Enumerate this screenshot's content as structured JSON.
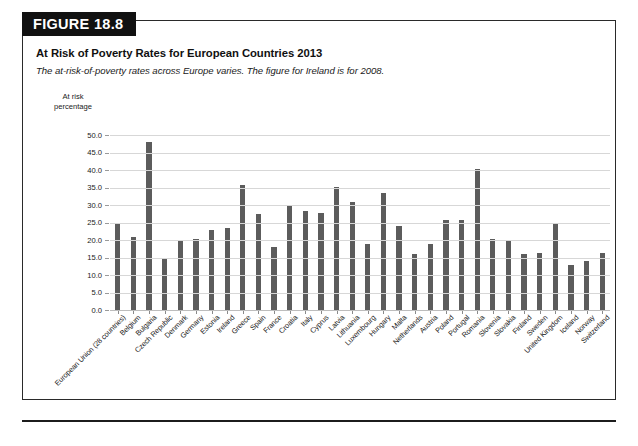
{
  "figure": {
    "badge_label": "FIGURE 18.8",
    "title": "At Risk of Poverty Rates for European Countries 2013",
    "subtitle": "The at-risk-of-poverty rates across Europe varies. The figure for Ireland is for 2008.",
    "axis_caption_line1": "At risk",
    "axis_caption_line2": "percentage"
  },
  "colors": {
    "bar": "#5c5c5c",
    "badge_background": "#111111",
    "badge_text": "#ffffff",
    "gridline": "#d7d7d7",
    "frame": "#2a2a2a"
  },
  "chart_data": {
    "type": "bar",
    "title": "At Risk of Poverty Rates for European Countries 2013",
    "subtitle": "The at-risk-of-poverty rates across Europe varies. The figure for Ireland is for 2008.",
    "xlabel": "",
    "ylabel": "At risk percentage",
    "ylim": [
      0.0,
      50.0
    ],
    "ytick_labels": [
      "50.0",
      "45.0",
      "40.0",
      "35.0",
      "30.0",
      "25.0",
      "20.0",
      "15.0",
      "10.0",
      "5.0",
      "0.0"
    ],
    "ytick_values": [
      50.0,
      45.0,
      40.0,
      35.0,
      30.0,
      25.0,
      20.0,
      15.0,
      10.0,
      5.0,
      0.0
    ],
    "grid": true,
    "legend": false,
    "categories": [
      "European Union (28 countries)",
      "Belgium",
      "Bulgaria",
      "Czech Republic",
      "Denmark",
      "Germany",
      "Estonia",
      "Ireland",
      "Greece",
      "Spain",
      "France",
      "Croatia",
      "Italy",
      "Cyprus",
      "Latvia",
      "Lithuania",
      "Luxembourg",
      "Hungary",
      "Malta",
      "Netherlands",
      "Austria",
      "Poland",
      "Portugal",
      "Romania",
      "Slovenia",
      "Slovakia",
      "Finland",
      "Sweden",
      "United Kingdom",
      "Iceland",
      "Norway",
      "Switzerland"
    ],
    "values": [
      24.5,
      20.8,
      48.0,
      14.6,
      20.0,
      20.3,
      23.0,
      23.5,
      35.7,
      27.3,
      18.1,
      29.9,
      28.4,
      27.8,
      35.1,
      30.8,
      19.0,
      33.5,
      24.0,
      15.9,
      18.8,
      25.8,
      25.6,
      40.4,
      20.4,
      19.8,
      16.0,
      16.4,
      24.8,
      13.0,
      14.1,
      16.4
    ]
  }
}
